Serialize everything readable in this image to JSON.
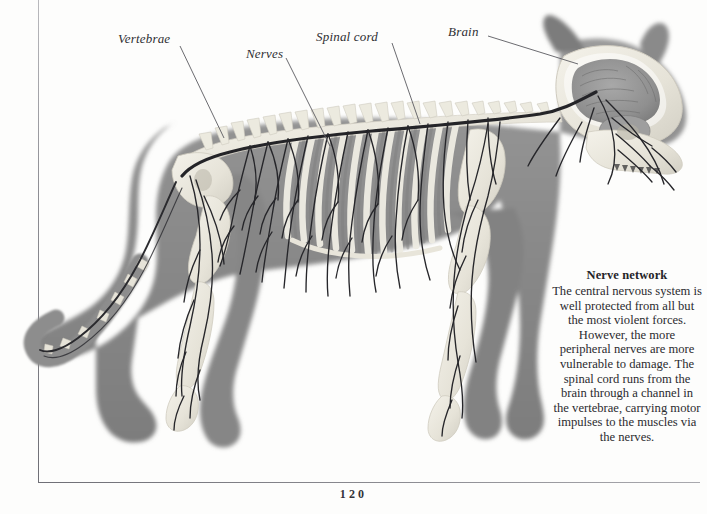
{
  "page": {
    "folio": "120",
    "background_color": "#fdfdfc",
    "rule_color": "#7a7a82"
  },
  "labels": [
    {
      "id": "vertebrae",
      "text": "Vertebrae",
      "leader": "line from label to spine column"
    },
    {
      "id": "nerves",
      "text": "Nerves",
      "leader": "line from label to thoracic nerve branch"
    },
    {
      "id": "spinal-cord",
      "text": "Spinal cord",
      "leader": "line from label to dorsal cord"
    },
    {
      "id": "brain",
      "text": "Brain",
      "leader": "line from label to cranial cavity"
    }
  ],
  "caption": {
    "heading": "Nerve network",
    "body": "The central nervous system is well protected from all but the most violent forces. However, the more peripheral nerves are more vulnerable to damage. The spinal cord runs from the brain through a channel in the vertebrae, carrying motor impulses to the muscles via the nerves."
  },
  "illustration": {
    "subject": "cat-anatomy-nervous-system",
    "description": "Side view of a cat showing skeleton and nervous system",
    "body_color": "#8c8c8c",
    "bone_color": "#ece9e0",
    "nerve_color": "#2a2a2e",
    "brain_color": "#9a9a9a"
  }
}
